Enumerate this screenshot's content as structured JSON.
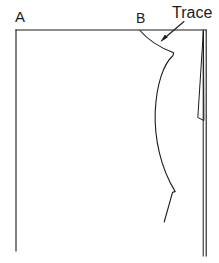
{
  "figure": {
    "type": "line-drawing",
    "background_color": "#ffffff",
    "line_color": "#1b1b1b",
    "line_width": 1
  },
  "labels": {
    "point_a": "A",
    "point_b": "B",
    "trace": "Trace"
  },
  "geometry": {
    "frame": {
      "top_line": {
        "x1": 16,
        "y1": 30,
        "x2": 206,
        "y2": 30
      },
      "left_line": {
        "x1": 16,
        "y1": 30,
        "x2": 16,
        "y2": 251
      },
      "right_outer_line": {
        "x1": 206,
        "y1": 30,
        "x2": 206,
        "y2": 256
      },
      "right_inner_line": {
        "x1": 203,
        "y1": 30,
        "x2": 203,
        "y2": 256
      }
    },
    "dart": {
      "apex": {
        "x": 203,
        "y": 30
      },
      "left_leg_end": {
        "x": 198,
        "y": 118
      },
      "right_leg_end": {
        "x": 204,
        "y": 120
      },
      "close_y": 120
    },
    "trace_curve": {
      "start": {
        "x": 140,
        "y": 30
      },
      "vertex_upper": {
        "x": 174,
        "y": 53
      },
      "bulge_left": {
        "x": 155,
        "y": 120
      },
      "vertex_lower": {
        "x": 175,
        "y": 192
      },
      "end": {
        "x": 164,
        "y": 222
      }
    },
    "trace_arrow": {
      "tail": {
        "x": 184,
        "y": 22
      },
      "head": {
        "x": 162,
        "y": 41
      }
    }
  }
}
